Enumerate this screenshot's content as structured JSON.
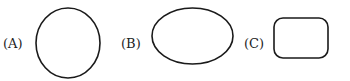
{
  "options": [
    {
      "label": "(A)",
      "shape": "circle"
    },
    {
      "label": "(B)",
      "shape": "ellipse"
    },
    {
      "label": "(C)",
      "shape": "rounded-rectangle"
    }
  ],
  "colors": {
    "stroke": "#1a1a1a",
    "background": "#ffffff"
  }
}
